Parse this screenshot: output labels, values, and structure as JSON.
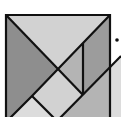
{
  "figure": {
    "type": "tangram-square-diagram",
    "width": 121,
    "height": 117
  },
  "colors": {
    "background": "#ffffff",
    "stroke": "#111111",
    "light_gray": "#d2d2d2",
    "mid_gray": "#b4b4b4",
    "dark_gray": "#8e8e8e",
    "darker_gray": "#9c9c9c",
    "pale_gray": "#dcdcdc"
  },
  "pieces": [
    {
      "name": "top-triangle",
      "shade": "light_gray",
      "points": "6,15 110,15 58,69"
    },
    {
      "name": "left-triangle",
      "shade": "dark_gray",
      "points": "6,15 58,69 32,96 6,122"
    },
    {
      "name": "center-square",
      "shade": "light_gray",
      "points": "58,69 83,95 58,120 32,96"
    },
    {
      "name": "middle-parallelogram",
      "shade": "mid_gray",
      "points": "58,69 83,43 83,95"
    },
    {
      "name": "right-strip",
      "shade": "darker_gray",
      "points": "83,43 110,15 110,67 83,95"
    },
    {
      "name": "bottom-left-triangle",
      "shade": "pale_gray",
      "points": "32,96 58,120 6,122"
    },
    {
      "name": "bottom-right-triangle",
      "shade": "mid_gray",
      "points": "83,95 110,67 110,120 58,120"
    },
    {
      "name": "outside-right-wedge",
      "shade": "pale_gray",
      "points": "110,67 121,56 121,117 110,117"
    }
  ],
  "lines": [
    {
      "name": "outer-square",
      "points": "6,122 6,15 110,15 110,122"
    },
    {
      "name": "diagonal-top-left",
      "points": "6,15 58,69"
    },
    {
      "name": "diagonal-top-right",
      "points": "110,15 32,96 6,122"
    },
    {
      "name": "vertical-divider",
      "points": "83,43 83,95"
    },
    {
      "name": "center-lower-right",
      "points": "58,69 83,95"
    },
    {
      "name": "rising-line",
      "points": "58,120 121,56"
    },
    {
      "name": "lower-left-diagonal",
      "points": "32,96 55,119"
    }
  ],
  "marker": {
    "name": "dot",
    "cx": 117,
    "cy": 40,
    "r": 1.8
  }
}
